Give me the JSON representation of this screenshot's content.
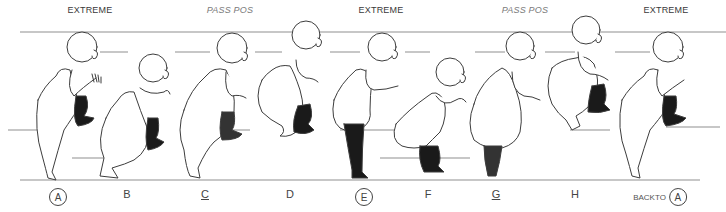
{
  "sheet": {
    "type": "animation-key-pose-sheet",
    "headers": [
      {
        "text": "EXTREME",
        "x": 90,
        "style": "extreme"
      },
      {
        "text": "PASS POS",
        "x": 230,
        "style": "pass"
      },
      {
        "text": "EXTREME",
        "x": 381,
        "style": "extreme"
      },
      {
        "text": "PASS POS",
        "x": 525,
        "style": "pass"
      },
      {
        "text": "EXTREME",
        "x": 666,
        "style": "extreme"
      }
    ],
    "frames": [
      {
        "label": "A",
        "marker": "circled",
        "x": 58
      },
      {
        "label": "B",
        "marker": "plain",
        "x": 127
      },
      {
        "label": "C",
        "marker": "underlined",
        "x": 205
      },
      {
        "label": "D",
        "marker": "plain",
        "x": 290
      },
      {
        "label": "E",
        "marker": "circled",
        "x": 364
      },
      {
        "label": "F",
        "marker": "plain",
        "x": 428
      },
      {
        "label": "G",
        "marker": "underlined",
        "x": 496
      },
      {
        "label": "H",
        "marker": "plain",
        "x": 575
      }
    ],
    "back_to": {
      "prefix": "BACKTO",
      "label": "A",
      "x": 652
    },
    "colors": {
      "paper": "#ffffff",
      "line": "#555555",
      "guide": "#9a9a9a",
      "ink_fill": "#1a1a1a"
    }
  }
}
